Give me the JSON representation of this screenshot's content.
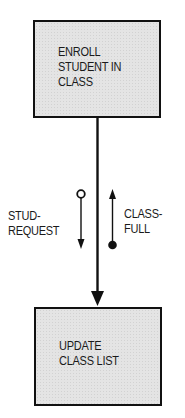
{
  "diagram": {
    "type": "structure-chart",
    "modules": [
      {
        "id": "top",
        "label": "ENROLL\nSTUDENT IN\nCLASS"
      },
      {
        "id": "bottom",
        "label": "UPDATE\nCLASS LIST"
      }
    ],
    "connection": {
      "from": "top",
      "to": "bottom",
      "arrow": "down"
    },
    "couples": [
      {
        "label": "STUD-\nREQUEST",
        "kind": "data-couple",
        "tail_icon": "open-circle",
        "direction": "down",
        "side": "left"
      },
      {
        "label": "CLASS-\nFULL",
        "kind": "control-flag",
        "tail_icon": "filled-circle",
        "direction": "up",
        "side": "right"
      }
    ],
    "colors": {
      "box_fill": "#e4e4e4",
      "stroke": "#111111",
      "text": "#1a1a1a",
      "background": "#ffffff"
    }
  }
}
